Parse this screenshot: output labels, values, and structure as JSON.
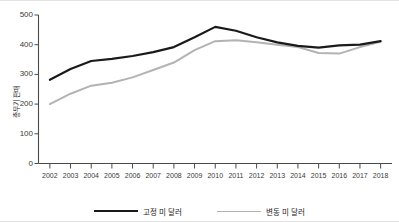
{
  "chart_data": {
    "type": "line",
    "title": "",
    "xlabel": "",
    "ylabel": "총무기 판매",
    "ylim": [
      0,
      500
    ],
    "yticks": [
      0,
      100,
      200,
      300,
      400,
      500
    ],
    "grid": false,
    "legend_position": "bottom",
    "x": [
      2002,
      2003,
      2004,
      2005,
      2006,
      2007,
      2008,
      2009,
      2010,
      2011,
      2012,
      2013,
      2014,
      2015,
      2016,
      2017,
      2018
    ],
    "categories": [
      "2002",
      "2003",
      "2004",
      "2005",
      "2006",
      "2007",
      "2008",
      "2009",
      "2010",
      "2011",
      "2012",
      "2013",
      "2014",
      "2015",
      "2016",
      "2017",
      "2018"
    ],
    "series": [
      {
        "name": "고정 미 달러",
        "color": "#1a1a1a",
        "width": 2.2,
        "values": [
          282,
          318,
          345,
          352,
          362,
          375,
          392,
          425,
          460,
          447,
          425,
          408,
          396,
          390,
          398,
          400,
          412
        ]
      },
      {
        "name": "변동 미 달러",
        "color": "#b3b3b3",
        "width": 2.0,
        "values": [
          200,
          235,
          262,
          272,
          290,
          315,
          340,
          382,
          412,
          415,
          408,
          400,
          392,
          372,
          370,
          392,
          410
        ]
      }
    ]
  },
  "axis": {
    "y_tick_labels": [
      "500",
      "400",
      "300",
      "200",
      "100",
      "0"
    ],
    "x_tick_labels": [
      "2002",
      "2003",
      "2004",
      "2005",
      "2006",
      "2007",
      "2008",
      "2009",
      "2010",
      "2011",
      "2012",
      "2013",
      "2014",
      "2015",
      "2016",
      "2017",
      "2018"
    ]
  },
  "legend": {
    "items": [
      {
        "label": "고정 미 달러",
        "color": "#1a1a1a"
      },
      {
        "label": "변동 미 달러",
        "color": "#b3b3b3"
      }
    ]
  }
}
